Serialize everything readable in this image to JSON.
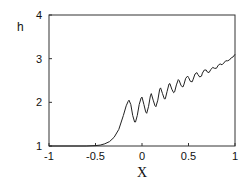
{
  "chart_data": {
    "type": "line",
    "title": "",
    "xlabel": "X",
    "ylabel": "h",
    "xlim": [
      -1,
      1
    ],
    "ylim": [
      1,
      4
    ],
    "grid": false,
    "legend": null,
    "x_ticks": [
      "-1",
      "-0.5",
      "0",
      "0.5",
      "1"
    ],
    "y_ticks": [
      "1",
      "2",
      "3",
      "4"
    ],
    "series": [
      {
        "name": "h(X)",
        "color": "#222222",
        "x": [
          -1.0,
          -0.6,
          -0.5,
          -0.45,
          -0.4,
          -0.35,
          -0.3,
          -0.25,
          -0.2,
          -0.17,
          -0.15,
          -0.14,
          -0.12,
          -0.1,
          -0.08,
          -0.07,
          -0.05,
          -0.03,
          -0.01,
          0.0,
          0.02,
          0.04,
          0.05,
          0.07,
          0.09,
          0.1,
          0.12,
          0.14,
          0.15,
          0.17,
          0.19,
          0.2,
          0.22,
          0.24,
          0.25,
          0.27,
          0.29,
          0.3,
          0.32,
          0.34,
          0.35,
          0.37,
          0.39,
          0.4,
          0.42,
          0.44,
          0.45,
          0.47,
          0.49,
          0.5,
          0.52,
          0.54,
          0.55,
          0.57,
          0.59,
          0.6,
          0.62,
          0.64,
          0.65,
          0.67,
          0.69,
          0.7,
          0.72,
          0.74,
          0.76,
          0.78,
          0.8,
          0.82,
          0.84,
          0.86,
          0.88,
          0.9,
          0.92,
          0.94,
          0.96,
          0.98,
          1.0
        ],
        "y": [
          1.0,
          1.0,
          1.01,
          1.02,
          1.05,
          1.1,
          1.2,
          1.38,
          1.7,
          1.92,
          2.02,
          2.05,
          1.95,
          1.7,
          1.55,
          1.55,
          1.7,
          1.95,
          2.1,
          2.12,
          1.95,
          1.78,
          1.75,
          1.9,
          2.15,
          2.2,
          2.05,
          1.92,
          1.9,
          2.05,
          2.3,
          2.33,
          2.2,
          2.08,
          2.08,
          2.25,
          2.42,
          2.43,
          2.3,
          2.22,
          2.24,
          2.4,
          2.52,
          2.5,
          2.38,
          2.35,
          2.4,
          2.55,
          2.6,
          2.57,
          2.48,
          2.47,
          2.53,
          2.65,
          2.68,
          2.64,
          2.58,
          2.6,
          2.67,
          2.74,
          2.74,
          2.7,
          2.68,
          2.75,
          2.8,
          2.78,
          2.78,
          2.85,
          2.88,
          2.86,
          2.9,
          2.95,
          2.95,
          2.97,
          3.02,
          3.04,
          3.1
        ]
      }
    ]
  }
}
